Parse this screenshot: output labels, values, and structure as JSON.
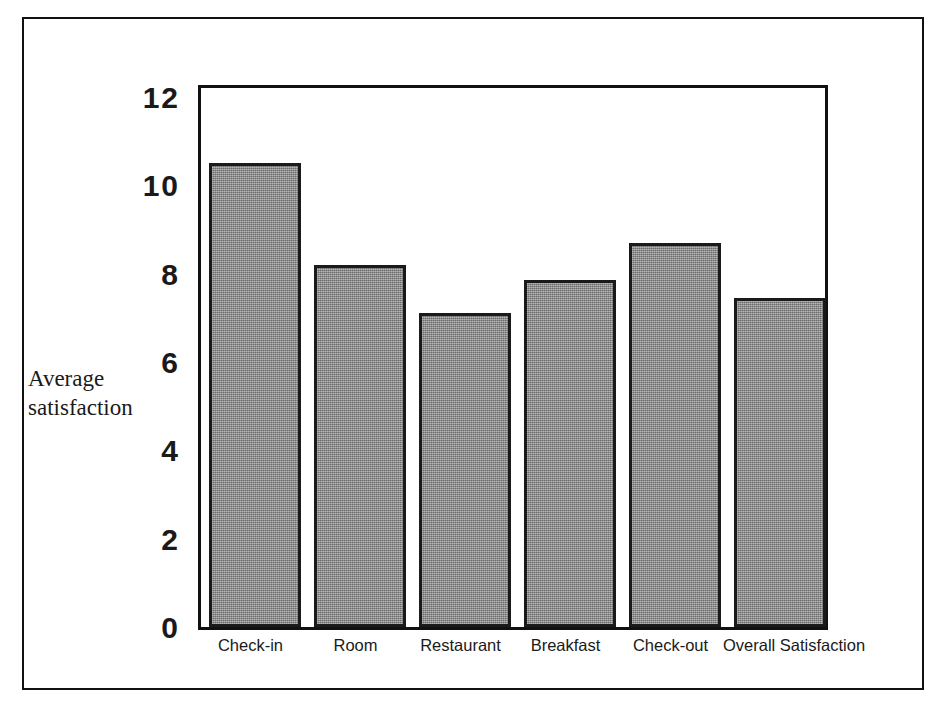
{
  "chart_data": {
    "type": "bar",
    "title": "",
    "subtitle": "",
    "xlabel": "",
    "ylabel": "Average satisfaction",
    "ylabel_lines": [
      "Average",
      "satisfaction"
    ],
    "categories": [
      "Check-in",
      "Room",
      "Restaurant",
      "Breakfast",
      "Check-out",
      "Overall Satisfaction"
    ],
    "values": [
      10.5,
      8.2,
      7.1,
      7.85,
      8.7,
      7.45
    ],
    "ylim": [
      0,
      12
    ],
    "ytick_labels": [
      "0",
      "2",
      "4",
      "6",
      "8",
      "10",
      "12"
    ],
    "ytick_values": [
      0,
      2,
      4,
      6,
      8,
      10,
      12
    ],
    "grid": false,
    "legend": null,
    "legend_position": "none",
    "bar_fill_color": "#8a8a8a",
    "bar_edge_color": "#1a1a1a",
    "frame_color": "#111111",
    "background_color": "#ffffff"
  }
}
